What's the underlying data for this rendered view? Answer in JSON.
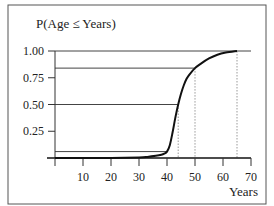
{
  "chart_data": {
    "type": "line",
    "title": "P(Age ≤ Years)",
    "xlabel": "Years",
    "ylabel": "P(Age ≤ Years)",
    "xlim": [
      0,
      70
    ],
    "ylim": [
      0,
      1.0
    ],
    "x_ticks": [
      10,
      20,
      30,
      40,
      50,
      60,
      70
    ],
    "y_ticks": [
      0.25,
      0.5,
      0.75,
      1.0
    ],
    "y_tick_labels": [
      "0.25",
      "0.50",
      "0.75",
      "1.00"
    ],
    "grid": false,
    "legend": null,
    "series": [
      {
        "name": "Cumulative probability",
        "x": [
          0,
          10,
          20,
          30,
          33,
          36,
          38,
          39,
          40,
          41,
          42,
          43,
          44,
          45,
          46,
          47,
          48,
          50,
          52,
          55,
          58,
          61,
          65
        ],
        "y": [
          0.0,
          0.0,
          0.0,
          0.005,
          0.01,
          0.02,
          0.03,
          0.04,
          0.06,
          0.12,
          0.24,
          0.38,
          0.5,
          0.6,
          0.68,
          0.74,
          0.78,
          0.84,
          0.88,
          0.93,
          0.965,
          0.985,
          1.0
        ]
      }
    ],
    "annotations": {
      "horizontal_lines": [
        {
          "y": 1.0,
          "x_end": 70
        },
        {
          "y": 0.84,
          "x_end": 50
        },
        {
          "y": 0.5,
          "x_end": 44
        },
        {
          "y": 0.06,
          "x_end": 40
        }
      ],
      "vertical_dotted_lines": [
        {
          "x": 44,
          "y_top": 0.5
        },
        {
          "x": 50,
          "y_top": 0.84
        },
        {
          "x": 65,
          "y_top": 1.0
        }
      ]
    }
  }
}
